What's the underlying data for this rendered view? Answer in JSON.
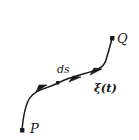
{
  "figure": {
    "type": "curve-diagram",
    "background_color": "#ffffff",
    "stroke_color": "#1a1a1a",
    "labels": {
      "start_point": "P",
      "end_point": "Q",
      "arc_element": "ds",
      "parametrization": "ξ(t)"
    },
    "markers": {
      "start_dot": "start-point-dot",
      "end_dot": "end-point-dot",
      "tick_dot": "curve-tick-dot",
      "arrowheads": [
        "direction-arrow-1",
        "direction-arrow-2",
        "direction-arrow-3"
      ]
    },
    "geometry": {
      "start": [
        22,
        130
      ],
      "end": [
        112,
        38
      ],
      "control_1": [
        26,
        86
      ],
      "control_2": [
        108,
        82
      ],
      "arrow_points": [
        [
          42,
          88
        ],
        [
          75,
          79
        ],
        [
          97,
          71
        ]
      ],
      "tick_point": [
        58,
        83
      ]
    }
  }
}
